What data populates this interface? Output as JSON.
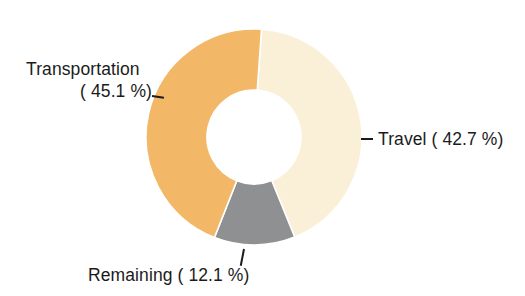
{
  "chart_data": {
    "type": "pie",
    "variant": "donut",
    "title": "",
    "subtitle": "",
    "xlabel": "",
    "ylabel": "",
    "legend_position": "none",
    "grid": false,
    "units": "percent",
    "categories": [
      "Travel",
      "Remaining",
      "Transportation"
    ],
    "values": [
      42.7,
      12.1,
      45.1
    ],
    "colors": [
      "#faf0d8",
      "#8e9092",
      "#f2b767"
    ],
    "slices": [
      {
        "name": "Travel",
        "value": 42.7,
        "label": "Travel ( 42.7 %)",
        "value_text": "42.7 %",
        "color": "#faf0d8",
        "leader": "dash-left"
      },
      {
        "name": "Remaining",
        "value": 12.1,
        "label": "Remaining ( 12.1 %)",
        "value_text": "12.1 %",
        "color": "#8e9092",
        "leader": "tick-up"
      },
      {
        "name": "Transportation",
        "value": 45.1,
        "label_line1": "Transportation",
        "label_line2": "( 45.1 %)",
        "label": "Transportation ( 45.1 %)",
        "value_text": "45.1 %",
        "color": "#f2b767",
        "leader": "dash-right"
      }
    ],
    "geometry": {
      "center_x": 254,
      "center_y": 137,
      "outer_radius": 108,
      "inner_radius": 47,
      "start_angle_deg": -86
    },
    "annotations": {
      "transportation_line1": "Transportation",
      "transportation_line2": "( 45.1 %)",
      "travel": "Travel ( 42.7 %)",
      "travel_dash": "–",
      "remaining": "Remaining ( 12.1 %)"
    }
  },
  "colors": {
    "transportation": "#f2b767",
    "travel": "#faf0d8",
    "remaining": "#8e9092",
    "text": "#1b1b1b",
    "background": "#ffffff"
  }
}
